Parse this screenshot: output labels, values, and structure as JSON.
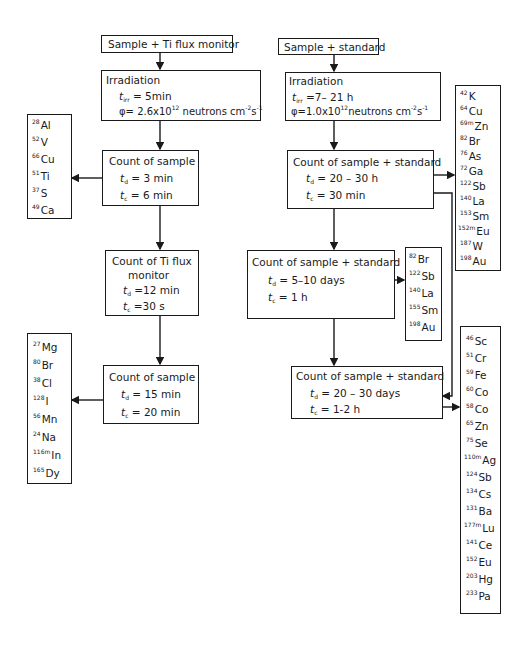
{
  "left_branch": {
    "start": {
      "label": "Sample + Ti flux monitor"
    },
    "irradiation": {
      "title": "Irradiation",
      "t_irr_label": "t",
      "t_irr_sub": "irr",
      "t_irr_value": " = 5min",
      "flux_symbol": "φ",
      "flux_value": "= 2.6x10",
      "flux_exp": "12",
      "flux_unit_a": " neutrons cm",
      "flux_unit_exp_a": "-2",
      "flux_unit_b": "s",
      "flux_unit_exp_b": "-1"
    },
    "count1": {
      "title": "Count of sample",
      "td_label": "t",
      "td_sub": "d",
      "td_value": " = 3 min",
      "tc_label": "t",
      "tc_sub": "c",
      "tc_value": " = 6 min"
    },
    "count2": {
      "title_line1": "Count of Ti flux",
      "title_line2": "monitor",
      "td_label": "t",
      "td_sub": "d",
      "td_value": " =12  min",
      "tc_label": "t",
      "tc_sub": "c",
      "tc_value": " =30  s"
    },
    "count3": {
      "title": "Count of sample",
      "td_label": "t",
      "td_sub": "d",
      "td_value": " = 15  min",
      "tc_label": "t",
      "tc_sub": "c",
      "tc_value": " = 20  min"
    },
    "nuclides1": [
      {
        "mass": "28",
        "el": "Al"
      },
      {
        "mass": "52",
        "el": "V"
      },
      {
        "mass": "66",
        "el": "Cu"
      },
      {
        "mass": "51",
        "el": "Ti"
      },
      {
        "mass": "37",
        "el": "S"
      },
      {
        "mass": "49",
        "el": "Ca"
      }
    ],
    "nuclides2": [
      {
        "mass": "27",
        "el": "Mg"
      },
      {
        "mass": "80",
        "el": "Br"
      },
      {
        "mass": "38",
        "el": "Cl"
      },
      {
        "mass": "128",
        "el": "I"
      },
      {
        "mass": "56",
        "el": "Mn"
      },
      {
        "mass": "24",
        "el": "Na"
      },
      {
        "mass": "116m",
        "el": "In"
      },
      {
        "mass": "165",
        "el": "Dy"
      }
    ]
  },
  "right_branch": {
    "start": {
      "label": "Sample + standard"
    },
    "irradiation": {
      "title": "Irradiation",
      "t_irr_label": "t",
      "t_irr_sub": "irr",
      "t_irr_value": " =7– 21 h",
      "flux_symbol": "φ",
      "flux_value": "=1.0x10",
      "flux_exp": "12",
      "flux_unit_a": "neutrons cm",
      "flux_unit_exp_a": "-2",
      "flux_unit_b": "s",
      "flux_unit_exp_b": "-1"
    },
    "count1": {
      "title": "Count of sample + standard",
      "td_label": "t",
      "td_sub": "d",
      "td_value": " = 20 – 30  h",
      "tc_label": "t",
      "tc_sub": "c",
      "tc_value": " = 30  min"
    },
    "count2": {
      "title": "Count of sample + standard",
      "td_label": "t",
      "td_sub": "d",
      "td_value": " = 5–10 days",
      "tc_label": "t",
      "tc_sub": "c",
      "tc_value": " = 1 h"
    },
    "count3": {
      "title": "Count of sample + standard",
      "td_label": "t",
      "td_sub": "d",
      "td_value": " = 20 – 30  days",
      "tc_label": "t",
      "tc_sub": "c",
      "tc_value": " = 1-2  h"
    },
    "nuclides_top": [
      {
        "mass": "42",
        "el": "K"
      },
      {
        "mass": "64",
        "el": "Cu"
      },
      {
        "mass": "69m",
        "el": "Zn"
      },
      {
        "mass": "82",
        "el": "Br"
      },
      {
        "mass": "76",
        "el": "As"
      },
      {
        "mass": "72",
        "el": "Ga"
      },
      {
        "mass": "122",
        "el": "Sb"
      },
      {
        "mass": "140",
        "el": "La"
      },
      {
        "mass": "153",
        "el": "Sm"
      },
      {
        "mass": "152m",
        "el": "Eu"
      },
      {
        "mass": "187",
        "el": "W"
      },
      {
        "mass": "198",
        "el": "Au"
      }
    ],
    "nuclides_mid": [
      {
        "mass": "82",
        "el": "Br"
      },
      {
        "mass": "122",
        "el": "Sb"
      },
      {
        "mass": "140",
        "el": "La"
      },
      {
        "mass": "155",
        "el": "Sm"
      },
      {
        "mass": "198",
        "el": "Au"
      }
    ],
    "nuclides_bottom": [
      {
        "mass": "46",
        "el": "Sc"
      },
      {
        "mass": "51",
        "el": "Cr"
      },
      {
        "mass": "59",
        "el": "Fe"
      },
      {
        "mass": "60",
        "el": "Co"
      },
      {
        "mass": "58",
        "el": "Co"
      },
      {
        "mass": "65",
        "el": "Zn"
      },
      {
        "mass": "75",
        "el": "Se"
      },
      {
        "mass": "110m",
        "el": "Ag"
      },
      {
        "mass": "124",
        "el": "Sb"
      },
      {
        "mass": "134",
        "el": "Cs"
      },
      {
        "mass": "131",
        "el": "Ba"
      },
      {
        "mass": "177m",
        "el": "Lu"
      },
      {
        "mass": "141",
        "el": "Ce"
      },
      {
        "mass": "152",
        "el": "Eu"
      },
      {
        "mass": "203",
        "el": "Hg"
      },
      {
        "mass": "233",
        "el": "Pa"
      }
    ]
  }
}
